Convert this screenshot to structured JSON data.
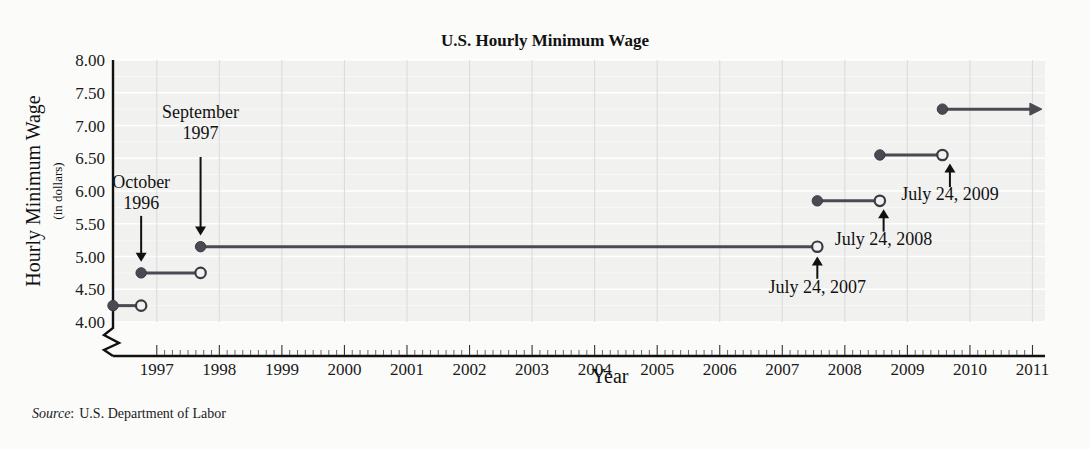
{
  "chart_data": {
    "type": "line",
    "subtype": "step-function",
    "title": "U.S. Hourly Minimum Wage",
    "xlabel": "Year",
    "ylabel": "Hourly Minimum Wage",
    "ylabel_sub": "(in dollars)",
    "ylim": [
      4.0,
      8.0
    ],
    "xlim": [
      1996.3,
      2011.2
    ],
    "y_ticks": [
      "8.00",
      "7.50",
      "7.00",
      "6.50",
      "6.00",
      "5.50",
      "5.00",
      "4.50",
      "4.00"
    ],
    "y_tick_values": [
      8.0,
      7.5,
      7.0,
      6.5,
      6.0,
      5.5,
      5.0,
      4.5,
      4.0
    ],
    "x_ticks": [
      "1997",
      "1998",
      "1999",
      "2000",
      "2001",
      "2002",
      "2003",
      "2004",
      "2005",
      "2006",
      "2007",
      "2008",
      "2009",
      "2010",
      "2011"
    ],
    "x_tick_values": [
      1997,
      1998,
      1999,
      2000,
      2001,
      2002,
      2003,
      2004,
      2005,
      2006,
      2007,
      2008,
      2009,
      2010,
      2011
    ],
    "grid": "horizontal-white-and-vertical-gray",
    "y_axis_break": true,
    "legend": "none",
    "segments": [
      {
        "label": "pre-Oct 1996",
        "wage": 4.25,
        "x_start": 1996.3,
        "x_end": 1996.75,
        "left_endpoint": "closed",
        "right_endpoint": "open",
        "arrow": false
      },
      {
        "label": "October 1996",
        "wage": 4.75,
        "x_start": 1996.75,
        "x_end": 1997.7,
        "left_endpoint": "closed",
        "right_endpoint": "open",
        "arrow": false
      },
      {
        "label": "September 1997",
        "wage": 5.15,
        "x_start": 1997.7,
        "x_end": 2007.56,
        "left_endpoint": "closed",
        "right_endpoint": "open",
        "arrow": false
      },
      {
        "label": "July 24, 2007",
        "wage": 5.85,
        "x_start": 2007.56,
        "x_end": 2008.56,
        "left_endpoint": "closed",
        "right_endpoint": "open",
        "arrow": false
      },
      {
        "label": "July 24, 2008",
        "wage": 6.55,
        "x_start": 2008.56,
        "x_end": 2009.56,
        "left_endpoint": "closed",
        "right_endpoint": "open",
        "arrow": false
      },
      {
        "label": "July 24, 2009",
        "wage": 7.25,
        "x_start": 2009.56,
        "x_end": 2011.15,
        "left_endpoint": "closed",
        "right_endpoint": "arrow",
        "arrow": true
      }
    ],
    "annotations": [
      {
        "name": "october-1996",
        "line1": "October",
        "line2": "1996",
        "text_x": 1996.75,
        "text_y": 6.05,
        "arrow_from_y": 5.62,
        "arrow_to_y": 4.92,
        "arrow_dir": "down"
      },
      {
        "name": "september-1997",
        "line1": "September",
        "line2": "1997",
        "text_x": 1997.7,
        "text_y": 7.12,
        "arrow_from_y": 6.52,
        "arrow_to_y": 5.32,
        "arrow_dir": "down"
      },
      {
        "name": "july-24-2007",
        "line1": "July 24, 2007",
        "line2": "",
        "text_x": 2007.56,
        "text_y": 4.45,
        "arrow_from_y": 4.66,
        "arrow_to_y": 5.0,
        "arrow_dir": "up"
      },
      {
        "name": "july-24-2008",
        "line1": "July 24, 2008",
        "line2": "",
        "text_x": 2008.62,
        "text_y": 5.18,
        "arrow_from_y": 5.38,
        "arrow_to_y": 5.72,
        "arrow_dir": "up"
      },
      {
        "name": "july-24-2009",
        "line1": "July 24, 2009",
        "line2": "",
        "text_x": 2009.68,
        "text_y": 5.86,
        "arrow_from_y": 6.06,
        "arrow_to_y": 6.42,
        "arrow_dir": "up"
      }
    ],
    "colors": {
      "plot_background": "#f1f1f0",
      "page_background": "#fbfbfa",
      "step_line": "#4a4a52",
      "axis": "#111111",
      "gridline_horizontal": "#ffffff",
      "gridline_vertical": "#dcdcdc",
      "text": "#111111"
    }
  },
  "source": {
    "prefix": "Source",
    "separator": ":",
    "text": "U.S. Department of Labor"
  }
}
